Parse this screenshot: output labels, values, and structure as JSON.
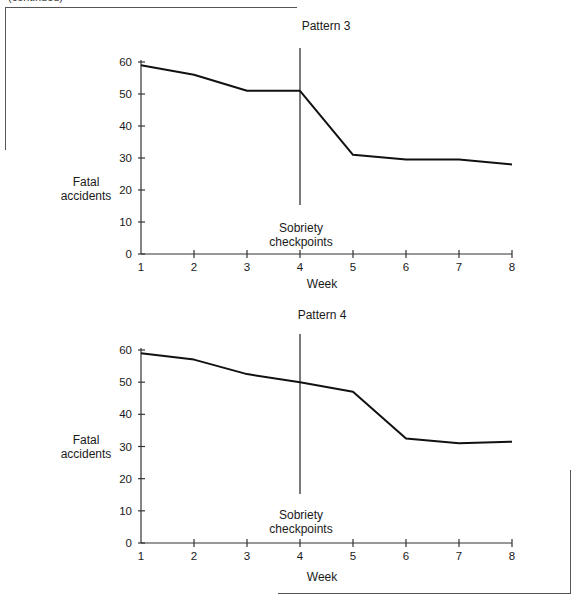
{
  "page": {
    "continued_label": "(continued)"
  },
  "chart_data": [
    {
      "type": "line",
      "title": "Pattern 3",
      "xlabel": "Week",
      "ylabel": "Fatal accidents",
      "x": [
        1,
        2,
        3,
        4,
        5,
        6,
        7,
        8
      ],
      "series": [
        {
          "name": "Fatal accidents",
          "values": [
            59,
            56,
            51,
            51,
            31,
            29.5,
            29.5,
            28
          ]
        }
      ],
      "xticks": [
        "1",
        "2",
        "3",
        "4",
        "5",
        "6",
        "7",
        "8"
      ],
      "yticks": [
        "0",
        "10",
        "20",
        "30",
        "40",
        "50",
        "60"
      ],
      "ylim": [
        0,
        60
      ],
      "xlim": [
        1,
        8
      ],
      "grid": false,
      "legend": "none",
      "annotations": [
        {
          "type": "vertical-line",
          "x": 4,
          "label": "Sobriety checkpoints"
        }
      ]
    },
    {
      "type": "line",
      "title": "Pattern 4",
      "xlabel": "Week",
      "ylabel": "Fatal accidents",
      "x": [
        1,
        2,
        3,
        4,
        5,
        6,
        7,
        8
      ],
      "series": [
        {
          "name": "Fatal accidents",
          "values": [
            59,
            57,
            52.5,
            50,
            47,
            32.5,
            31,
            31.5
          ]
        }
      ],
      "xticks": [
        "1",
        "2",
        "3",
        "4",
        "5",
        "6",
        "7",
        "8"
      ],
      "yticks": [
        "0",
        "10",
        "20",
        "30",
        "40",
        "50",
        "60"
      ],
      "ylim": [
        0,
        60
      ],
      "xlim": [
        1,
        8
      ],
      "grid": false,
      "legend": "none",
      "annotations": [
        {
          "type": "vertical-line",
          "x": 4,
          "label": "Sobriety checkpoints"
        }
      ]
    }
  ],
  "charts": [
    {
      "title": "Pattern 3",
      "ylabel_line1": "Fatal",
      "ylabel_line2": "accidents",
      "xlabel": "Week",
      "annotation_line1": "Sobriety",
      "annotation_line2": "checkpoints"
    },
    {
      "title": "Pattern 4",
      "ylabel_line1": "Fatal",
      "ylabel_line2": "accidents",
      "xlabel": "Week",
      "annotation_line1": "Sobriety",
      "annotation_line2": "checkpoints"
    }
  ]
}
